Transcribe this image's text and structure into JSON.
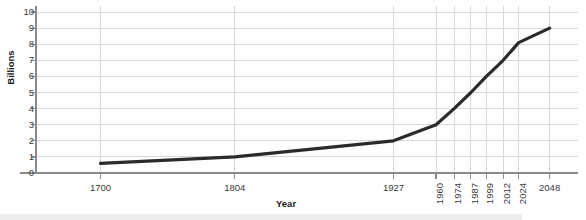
{
  "chart_data": {
    "type": "line",
    "title": "",
    "xlabel": "Year",
    "ylabel": "Billions",
    "grid": true,
    "legend": false,
    "xlim": [
      1650,
      2070
    ],
    "ylim": [
      0,
      10
    ],
    "yticks": [
      0,
      1,
      2,
      3,
      4,
      5,
      6,
      7,
      8,
      9,
      10
    ],
    "ytick_labels": [
      "0",
      "1",
      "2",
      "3",
      "4",
      "5",
      "6",
      "7",
      "8",
      "9",
      "10"
    ],
    "xticks": [
      1700,
      1804,
      1927,
      1960,
      1974,
      1987,
      1999,
      2012,
      2024,
      2048
    ],
    "xtick_labels": [
      "1700",
      "1804",
      "1927",
      "1960",
      "1974",
      "1987",
      "1999",
      "2012",
      "2024",
      "2048"
    ],
    "xtick_label_rotation": [
      0,
      0,
      0,
      90,
      90,
      90,
      90,
      90,
      90,
      0
    ],
    "x": [
      1700,
      1804,
      1927,
      1960,
      1974,
      1987,
      1999,
      2012,
      2024,
      2048
    ],
    "y": [
      0.6,
      1.0,
      2.0,
      3.0,
      4.0,
      5.0,
      6.0,
      7.0,
      8.1,
      9.0
    ],
    "series": [
      {
        "name": "World population",
        "color": "#2b2b2b",
        "values": [
          0.6,
          1.0,
          2.0,
          3.0,
          4.0,
          5.0,
          6.0,
          7.0,
          8.1,
          9.0
        ]
      }
    ],
    "line_color": "#2b2b2b",
    "grid_color": "#d9d9d9",
    "axis_color": "#8a8a8a"
  },
  "axes": {
    "y_title": "Billions",
    "x_title": "Year"
  }
}
